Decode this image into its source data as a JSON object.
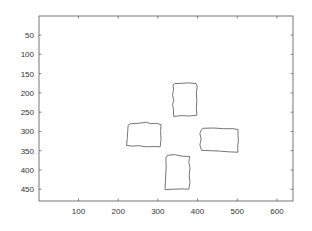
{
  "chart_data": {
    "type": "image",
    "title": "",
    "xlabel": "",
    "ylabel": "",
    "xlim": [
      0.5,
      640.5
    ],
    "ylim": [
      0.5,
      480.5
    ],
    "y_reversed": true,
    "grid": false,
    "legend": null,
    "x_ticks": [
      100,
      200,
      300,
      400,
      500,
      600
    ],
    "x_tick_labels": [
      "100",
      "200",
      "300",
      "400",
      "500",
      "600"
    ],
    "y_ticks": [
      50,
      100,
      150,
      200,
      250,
      300,
      350,
      400,
      450
    ],
    "y_tick_labels": [
      "50",
      "100",
      "150",
      "200",
      "250",
      "300",
      "350",
      "400",
      "450"
    ],
    "shapes": [
      {
        "name": "top-rectangle",
        "type": "polygon-outline",
        "x_range": [
          336,
          400
        ],
        "y_range": [
          172,
          261
        ],
        "points": [
          [
            342,
            176
          ],
          [
            360,
            175
          ],
          [
            378,
            174
          ],
          [
            396,
            176
          ],
          [
            399,
            182
          ],
          [
            397,
            200
          ],
          [
            398,
            220
          ],
          [
            397,
            240
          ],
          [
            398,
            258
          ],
          [
            380,
            260
          ],
          [
            360,
            259
          ],
          [
            340,
            261
          ],
          [
            339,
            240
          ],
          [
            337,
            230
          ],
          [
            340,
            220
          ],
          [
            337,
            205
          ],
          [
            340,
            190
          ],
          [
            338,
            180
          ]
        ]
      },
      {
        "name": "left-rectangle",
        "type": "polygon-outline",
        "x_range": [
          220,
          309
        ],
        "y_range": [
          274,
          341
        ],
        "points": [
          [
            232,
            280
          ],
          [
            252,
            279
          ],
          [
            270,
            276
          ],
          [
            282,
            280
          ],
          [
            296,
            279
          ],
          [
            308,
            282
          ],
          [
            307,
            300
          ],
          [
            308,
            320
          ],
          [
            306,
            340
          ],
          [
            290,
            339
          ],
          [
            270,
            340
          ],
          [
            252,
            337
          ],
          [
            234,
            338
          ],
          [
            221,
            336
          ],
          [
            223,
            318
          ],
          [
            224,
            300
          ],
          [
            225,
            284
          ]
        ]
      },
      {
        "name": "right-rectangle",
        "type": "polygon-outline",
        "x_range": [
          405,
          505
        ],
        "y_range": [
          289,
          357
        ],
        "points": [
          [
            414,
            292
          ],
          [
            440,
            291
          ],
          [
            466,
            293
          ],
          [
            490,
            293
          ],
          [
            502,
            295
          ],
          [
            502,
            310
          ],
          [
            503,
            325
          ],
          [
            501,
            340
          ],
          [
            502,
            354
          ],
          [
            480,
            353
          ],
          [
            456,
            351
          ],
          [
            432,
            350
          ],
          [
            410,
            349
          ],
          [
            406,
            335
          ],
          [
            409,
            320
          ],
          [
            406,
            305
          ],
          [
            410,
            295
          ]
        ]
      },
      {
        "name": "bottom-rectangle",
        "type": "polygon-outline",
        "x_range": [
          316,
          382
        ],
        "y_range": [
          357,
          453
        ],
        "points": [
          [
            324,
            362
          ],
          [
            342,
            360
          ],
          [
            360,
            364
          ],
          [
            380,
            365
          ],
          [
            378,
            380
          ],
          [
            381,
            395
          ],
          [
            379,
            415
          ],
          [
            381,
            432
          ],
          [
            378,
            450
          ],
          [
            360,
            449
          ],
          [
            340,
            450
          ],
          [
            318,
            451
          ],
          [
            319,
            430
          ],
          [
            320,
            410
          ],
          [
            321,
            390
          ],
          [
            320,
            370
          ]
        ]
      }
    ]
  },
  "axes": {
    "box_color": "#555555",
    "line_color": "#666666",
    "background": "#ffffff"
  }
}
